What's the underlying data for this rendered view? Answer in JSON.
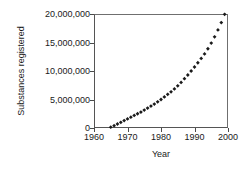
{
  "chart_data": {
    "type": "scatter",
    "title": "",
    "xlabel": "Year",
    "ylabel": "Substances registered",
    "xlim": [
      1960,
      2000
    ],
    "ylim": [
      0,
      20000000
    ],
    "grid": false,
    "legend": false,
    "marker": "diamond",
    "marker_color": "#1a1a1a",
    "xticks": [
      "1960",
      "1970",
      "1980",
      "1990",
      "2000"
    ],
    "xtick_values": [
      1960,
      1970,
      1980,
      1990,
      2000
    ],
    "yticks": [
      "0",
      "5,000,000",
      "10,000,000",
      "15,000,000",
      "20,000,000"
    ],
    "ytick_values": [
      0,
      5000000,
      10000000,
      15000000,
      20000000
    ],
    "x": [
      1965,
      1966,
      1967,
      1968,
      1969,
      1970,
      1971,
      1972,
      1973,
      1974,
      1975,
      1976,
      1977,
      1978,
      1979,
      1980,
      1981,
      1982,
      1983,
      1984,
      1985,
      1986,
      1987,
      1988,
      1989,
      1990,
      1991,
      1992,
      1993,
      1994,
      1995,
      1996,
      1997,
      1998,
      1999
    ],
    "values": [
      150000,
      400000,
      700000,
      1000000,
      1300000,
      1600000,
      1900000,
      2200000,
      2500000,
      2800000,
      3150000,
      3500000,
      3850000,
      4200000,
      4600000,
      5000000,
      5450000,
      5900000,
      6350000,
      6850000,
      7400000,
      8000000,
      8650000,
      9300000,
      10000000,
      10700000,
      11450000,
      12200000,
      13000000,
      13900000,
      14900000,
      16000000,
      17200000,
      18500000,
      19950000
    ]
  }
}
